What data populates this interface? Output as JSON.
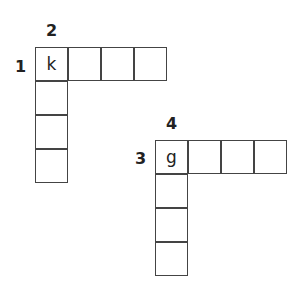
{
  "puzzle": {
    "grids": [
      {
        "id": "grid-1",
        "across_number": "1",
        "down_number": "2",
        "across_length": 4,
        "down_length": 4,
        "start_letter": "k",
        "across_letters": [
          "k",
          "",
          "",
          ""
        ],
        "down_letters": [
          "k",
          "",
          "",
          ""
        ]
      },
      {
        "id": "grid-2",
        "across_number": "3",
        "down_number": "4",
        "across_length": 4,
        "down_length": 4,
        "start_letter": "g",
        "across_letters": [
          "g",
          "",
          "",
          ""
        ],
        "down_letters": [
          "g",
          "",
          "",
          ""
        ]
      }
    ]
  }
}
